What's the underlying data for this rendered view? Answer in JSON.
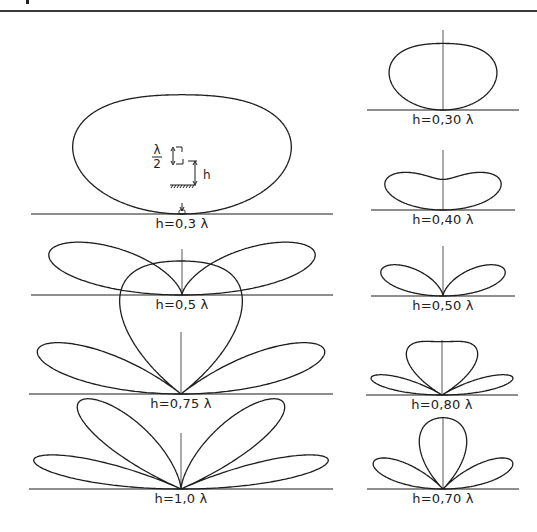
{
  "figure": {
    "inset": {
      "lambda_half_label_num": "λ",
      "lambda_half_label_den": "2",
      "h_label": "h"
    },
    "left_column": [
      {
        "id": "left-0.3",
        "h": 0.3,
        "label": "h=0,3 λ",
        "cx": 182,
        "baseline": 214,
        "half_width": 151,
        "scale": 66,
        "mode": "horizontal",
        "show_axis": false,
        "show_inset": true
      },
      {
        "id": "left-0.5",
        "h": 0.5,
        "label": "h=0,5 λ",
        "cx": 182,
        "baseline": 295,
        "half_width": 151,
        "scale": 48,
        "mode": "horizontal",
        "show_axis": true,
        "axis_top": 249
      },
      {
        "id": "left-0.75",
        "h": 0.75,
        "label": "h=0,75 λ",
        "cx": 181,
        "baseline": 394,
        "half_width": 152,
        "scale": 70,
        "mode": "horizontal",
        "show_axis": true,
        "axis_top": 332
      },
      {
        "id": "left-1.0",
        "h": 1.0,
        "label": "h=1,0 λ",
        "cx": 181,
        "baseline": 489,
        "half_width": 152,
        "scale": 62,
        "mode": "horizontal",
        "show_axis": true,
        "axis_top": 433
      }
    ],
    "right_column": [
      {
        "id": "right-0.30",
        "h": 0.3,
        "label": "h=0,30 λ",
        "cx": 443,
        "baseline": 110,
        "half_width": 76,
        "scale": 70,
        "mode": "vertical",
        "show_axis": true,
        "axis_top": 30
      },
      {
        "id": "right-0.40",
        "h": 0.4,
        "label": "h=0,40 λ",
        "cx": 443,
        "baseline": 210,
        "half_width": 72,
        "scale": 52,
        "mode": "vertical",
        "show_axis": true,
        "axis_top": 150
      },
      {
        "id": "right-0.50",
        "h": 0.5,
        "label": "h=0,50 λ",
        "cx": 443,
        "baseline": 296,
        "half_width": 72,
        "scale": 54,
        "mode": "vertical",
        "show_axis": true,
        "axis_top": 246
      },
      {
        "id": "right-0.80",
        "h": 0.8,
        "label": "h=0,80 λ",
        "cx": 442,
        "baseline": 395,
        "half_width": 76,
        "scale": 56,
        "mode": "vertical",
        "show_axis": true,
        "axis_top": 340
      },
      {
        "id": "right-0.70",
        "h": 0.7,
        "label": "h=0,70 λ",
        "cx": 443,
        "baseline": 489,
        "half_width": 76,
        "scale": 75,
        "mode": "vertical",
        "show_axis": true,
        "axis_top": 417
      }
    ]
  },
  "style": {
    "line_color": "#1e1e1e",
    "axis_color": "#444444",
    "background": "#ffffff"
  }
}
